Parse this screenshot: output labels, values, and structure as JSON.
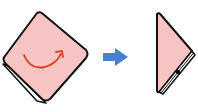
{
  "diagram": {
    "type": "folding-instruction",
    "steps": [
      {
        "label": "step-1-square-napkin",
        "shape": "tilted-square",
        "fill": "#f7c4c4",
        "outline": "#111111",
        "annotation": {
          "icon": "curved-arrow-fold-icon",
          "color": "#d9432b"
        }
      },
      {
        "label": "transition",
        "icon": "right-arrow-icon",
        "color": "#4a7fd1"
      },
      {
        "label": "step-2-folded-triangle",
        "shape": "triangle",
        "fill": "#f7c4c4",
        "outline": "#111111"
      }
    ]
  },
  "colors": {
    "paper_fill": "#f7c4c4",
    "outline": "#111111",
    "fold_arrow": "#d9432b",
    "next_arrow": "#4a7fd1",
    "background": "#ffffff"
  }
}
